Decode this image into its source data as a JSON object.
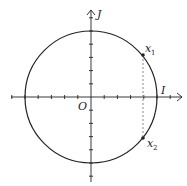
{
  "diagram": {
    "type": "unit-circle",
    "labels": {
      "origin": "O",
      "x_axis": "I",
      "y_axis": "J",
      "point1_base": "x",
      "point1_sub": "1",
      "point2_base": "x",
      "point2_sub": "2"
    },
    "geometry": {
      "center": [
        91,
        97
      ],
      "radius": 66,
      "tick_spacing": 13.2,
      "ticks_per_half_axis": 5,
      "point1": [
        143,
        55
      ],
      "point2": [
        143,
        138
      ]
    },
    "colors": {
      "stroke": "#222222",
      "dashed": "#999999",
      "background": "#ffffff"
    }
  }
}
